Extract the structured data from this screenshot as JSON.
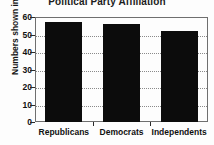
{
  "chart_data": {
    "type": "bar",
    "title": "Political Party Affiliation",
    "xlabel": "",
    "ylabel": "Numbers shown in percentages",
    "categories": [
      "Republicans",
      "Democrats",
      "Independents"
    ],
    "values": [
      57,
      56,
      52
    ],
    "ylim": [
      0,
      60
    ],
    "yticks": [
      0,
      10,
      20,
      30,
      40,
      50,
      60
    ],
    "ytick_labels": [
      "0",
      "10",
      "20",
      "30",
      "40",
      "50",
      "60"
    ],
    "grid": true,
    "grid_axis": "y",
    "grid_style": "dotted",
    "legend": false,
    "legend_position": "none",
    "bar_color": "#0c0c0c",
    "background_color": "#fdfdfd",
    "frame_color": "#6f6f6f",
    "title_clipped_top": true
  }
}
